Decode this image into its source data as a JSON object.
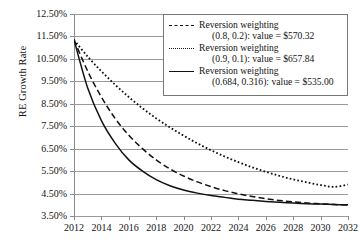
{
  "chart_data": {
    "type": "line",
    "title": "",
    "xlabel": "",
    "ylabel": "RE Growth Rate",
    "xlim": [
      2012,
      2032
    ],
    "ylim": [
      3.5,
      12.5
    ],
    "grid": true,
    "legend_position": "top-right",
    "x_ticks": [
      "2012",
      "2014",
      "2016",
      "2018",
      "2020",
      "2022",
      "2024",
      "2026",
      "2028",
      "2030",
      "2032"
    ],
    "y_ticks": [
      "3.50%",
      "4.50%",
      "5.50%",
      "6.50%",
      "7.50%",
      "8.50%",
      "9.50%",
      "10.50%",
      "11.50%",
      "12.50%"
    ],
    "x": [
      2012,
      2013,
      2014,
      2015,
      2016,
      2017,
      2018,
      2019,
      2020,
      2021,
      2022,
      2023,
      2024,
      2025,
      2026,
      2027,
      2028,
      2029,
      2030,
      2031,
      2032
    ],
    "series": [
      {
        "name": "Reversion weighting (0.8, 0.2): value = $570.32",
        "style": "dashed",
        "values": [
          11.35,
          9.95,
          8.8,
          7.85,
          7.1,
          6.5,
          6.0,
          5.6,
          5.28,
          5.02,
          4.81,
          4.63,
          4.49,
          4.37,
          4.27,
          4.19,
          4.13,
          4.08,
          4.04,
          4.01,
          3.99
        ]
      },
      {
        "name": "Reversion weighting (0.9, 0.1): value = $657.84",
        "style": "dotted",
        "values": [
          11.35,
          10.6,
          9.95,
          9.35,
          8.8,
          8.3,
          7.85,
          7.45,
          7.08,
          6.74,
          6.43,
          6.15,
          5.9,
          5.67,
          5.47,
          5.29,
          5.13,
          5.0,
          4.88,
          4.8,
          4.9
        ]
      },
      {
        "name": "Reversion weighting (0.684, 0.316): value = $535.00",
        "style": "solid",
        "values": [
          11.35,
          9.2,
          7.75,
          6.75,
          6.0,
          5.5,
          5.12,
          4.85,
          4.66,
          4.52,
          4.41,
          4.33,
          4.25,
          4.2,
          4.15,
          4.11,
          4.08,
          4.05,
          4.03,
          4.01,
          4.0
        ]
      }
    ],
    "legend": [
      {
        "style": "dashed",
        "line1": "Reversion weighting",
        "line2": "(0.8, 0.2): value = $570.32"
      },
      {
        "style": "dotted",
        "line1": "Reversion weighting",
        "line2": "(0.9, 0.1): value = $657.84"
      },
      {
        "style": "solid",
        "line1": "Reversion weighting",
        "line2": "(0.684, 0.316): value = $535.00"
      }
    ]
  }
}
